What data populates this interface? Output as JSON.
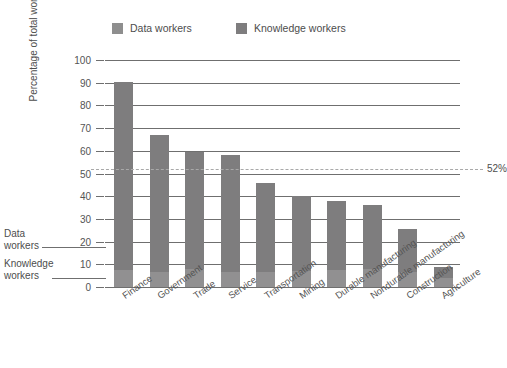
{
  "top_fragment": "",
  "legend": {
    "position": "top",
    "items": [
      {
        "label": "Data workers",
        "key": "data",
        "color": "#8e8e8e"
      },
      {
        "label": "Knowledge workers",
        "key": "knowledge",
        "color": "#7e7d7e"
      }
    ]
  },
  "annotations": {
    "left_callouts": [
      {
        "label": "Data\nworkers",
        "line1": "Data",
        "line2": "workers",
        "points_to": "data-segment"
      },
      {
        "label": "Knowledge\nworkers",
        "line1": "Knowledge",
        "line2": "workers",
        "points_to": "knowledge-segment"
      }
    ],
    "reference_line": {
      "label": "52%",
      "value": 52,
      "style": "dashed"
    }
  },
  "chart_data": {
    "type": "bar",
    "stacked": true,
    "title": "",
    "xlabel": "",
    "ylabel": "Percentage of total work force",
    "ylim": [
      0,
      100
    ],
    "ytick_step": 10,
    "yticks": [
      0,
      10,
      20,
      30,
      40,
      50,
      60,
      70,
      80,
      90,
      100
    ],
    "ytick_labels": [
      "0",
      "10",
      "20",
      "30",
      "40",
      "50",
      "60",
      "70",
      "80",
      "90",
      "100"
    ],
    "grid": true,
    "legend_position": "top",
    "categories": [
      "Finance",
      "Government",
      "Trade",
      "Service",
      "Transportation",
      "Mining",
      "Durable manufacturing",
      "Nondurable manufacturing",
      "Construction",
      "Agriculture"
    ],
    "series": [
      {
        "name": "Data workers",
        "color": "#919091",
        "values": [
          7.5,
          6.5,
          8.0,
          6.5,
          6.5,
          7.0,
          7.5,
          8.0,
          6.5,
          4.0
        ]
      },
      {
        "name": "Knowledge workers",
        "color": "#7e7d7e",
        "values": [
          83.0,
          60.5,
          51.5,
          51.5,
          39.5,
          33.0,
          30.5,
          28.0,
          19.0,
          5.0
        ]
      }
    ],
    "totals": [
      90.5,
      67.0,
      59.5,
      58.0,
      46.0,
      40.0,
      38.0,
      36.0,
      25.5,
      9.0
    ],
    "reference_lines": [
      {
        "value": 52,
        "label": "52%",
        "style": "dashed",
        "color": "#a9a9a9"
      }
    ]
  }
}
